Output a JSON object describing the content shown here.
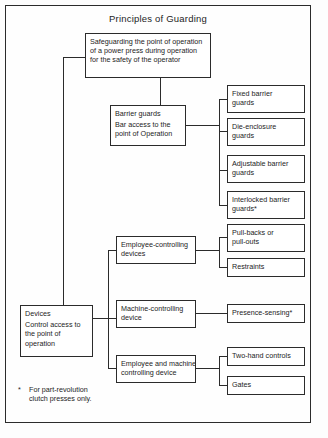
{
  "diagram": {
    "title": "Principles of Guarding",
    "footnote": {
      "marker": "*",
      "line1": "For part-revolution",
      "line2": "clutch presses only."
    },
    "nodes": {
      "root": {
        "name": "safeguarding-root",
        "line1": "Safeguarding the point of operation",
        "line2": "of a power press during operation",
        "line3": "for the safety of the operator"
      },
      "barrier_guards": {
        "name": "barrier-guards",
        "line1": "Barrier guards",
        "line2": "Bar access to the",
        "line3": "point of Operation"
      },
      "devices": {
        "name": "devices",
        "line1": "Devices",
        "line2": "Control access to",
        "line3": "the point of",
        "line4": "operation"
      },
      "employee_controlling": {
        "name": "employee-controlling-devices",
        "line1": "Employee-controlling",
        "line2": "devices"
      },
      "machine_controlling": {
        "name": "machine-controlling-device",
        "line1": "Machine-controlling",
        "line2": "device"
      },
      "employee_and_machine": {
        "name": "employee-and-machine-controlling-device",
        "line1": "Employee and machine-",
        "line2": "controlling device"
      },
      "fixed_barrier": {
        "name": "fixed-barrier-guards",
        "line1": "Fixed barrier",
        "line2": "guards"
      },
      "die_enclosure": {
        "name": "die-enclosure-guards",
        "line1": "Die-enclosure",
        "line2": "guards"
      },
      "adjustable_barrier": {
        "name": "adjustable-barrier-guards",
        "line1": "Adjustable barrier",
        "line2": "guards"
      },
      "interlocked_barrier": {
        "name": "interlocked-barrier-guards",
        "line1": "Interlocked barrier",
        "line2": "guards*"
      },
      "pull_backs": {
        "name": "pull-backs-or-pull-outs",
        "line1": "Pull-backs or",
        "line2": "pull-outs"
      },
      "restraints": {
        "name": "restraints",
        "line1": "Restraints"
      },
      "presence_sensing": {
        "name": "presence-sensing",
        "line1": "Presence-sensing*"
      },
      "two_hand_controls": {
        "name": "two-hand-controls",
        "line1": "Two-hand controls"
      },
      "gates": {
        "name": "gates",
        "line1": "Gates"
      }
    },
    "colors": {
      "ink": "#2b2b2b",
      "paper": "#fefefe"
    }
  }
}
